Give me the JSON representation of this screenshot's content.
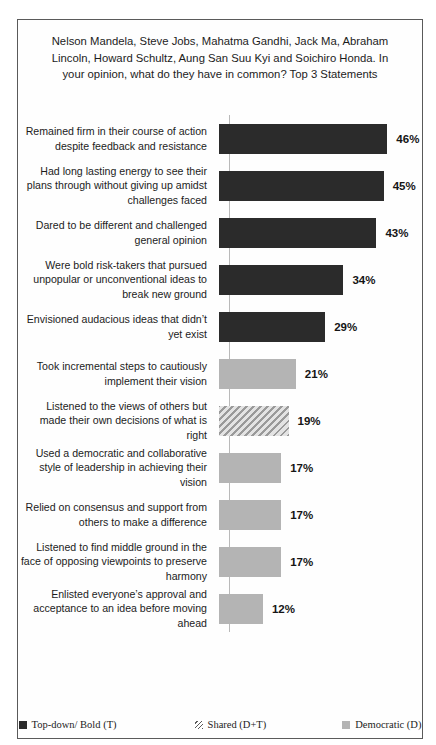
{
  "chart_data": {
    "type": "bar",
    "orientation": "horizontal",
    "title": "Nelson Mandela, Steve Jobs, Mahatma Gandhi, Jack Ma, Abraham Lincoln, Howard Schultz, Aung San Suu Kyi and Soichiro Honda. In your opinion, what do they have in common? Top 3 Statements",
    "xlabel": "",
    "ylabel": "",
    "xlim": [
      0,
      50
    ],
    "grid": false,
    "legend_position": "bottom",
    "value_suffix": "%",
    "categories": [
      "Remained firm in their course of action despite feedback and resistance",
      "Had long lasting energy to see their plans through without giving up amidst challenges faced",
      "Dared to be different and challenged general opinion",
      "Were bold risk-takers that pursued unpopular or unconventional ideas to break new ground",
      "Envisioned audacious  ideas that didn’t yet exist",
      "Took incremental steps to cautiously implement their vision",
      "Listened to the views of others but made their own decisions of what is right",
      "Used a democratic and collaborative style of leadership  in achieving their vision",
      "Relied on consensus and support from others to make a difference",
      "Listened to find middle ground in the face of opposing viewpoints  to preserve harmony",
      "Enlisted everyone’s approval and acceptance to an idea before moving ahead"
    ],
    "values": [
      46,
      45,
      43,
      34,
      29,
      21,
      19,
      17,
      17,
      17,
      12
    ],
    "value_labels": [
      "46%",
      "45%",
      "43%",
      "34%",
      "29%",
      "21%",
      "19%",
      "17%",
      "17%",
      "17%",
      "12%"
    ],
    "series_of_bar": [
      "topdown",
      "topdown",
      "topdown",
      "topdown",
      "topdown",
      "democratic",
      "shared",
      "democratic",
      "democratic",
      "democratic",
      "democratic"
    ],
    "legend": [
      {
        "key": "topdown",
        "label": "Top-down/ Bold (T)",
        "color": "#2b2b2b"
      },
      {
        "key": "shared",
        "label": "Shared (D+T)",
        "color": "#bdbdbd"
      },
      {
        "key": "democratic",
        "label": "Democratic (D)",
        "color": "#b4b4b4"
      }
    ]
  }
}
